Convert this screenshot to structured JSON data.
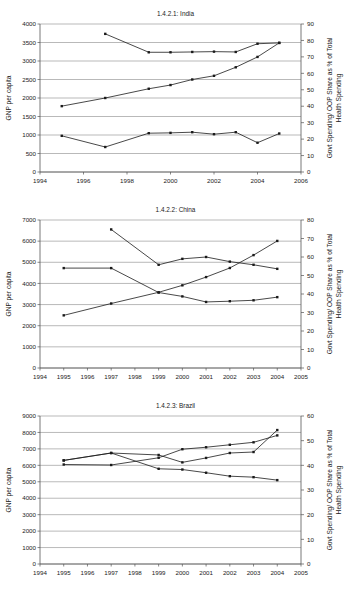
{
  "page": {
    "background": "#ffffff",
    "ink": "#1a1a1a",
    "grid_color": "#8a8a8a"
  },
  "charts": [
    {
      "id": "india",
      "title": "1.4.2.1: India",
      "ylabel": "GNP per capita",
      "ylabel_right": "Govt Spending/ OOP Share as % of Total Health Spending",
      "xlabel": "",
      "xlim": [
        1994,
        2006
      ],
      "xticks": [
        1994,
        1996,
        1998,
        2000,
        2002,
        2004,
        2006
      ],
      "ylim": [
        0,
        4000
      ],
      "yticks": [
        0,
        500,
        1000,
        1500,
        2000,
        2500,
        3000,
        3500,
        4000
      ],
      "ylim_right": [
        0,
        90
      ],
      "yticks_right": [
        0,
        10,
        20,
        30,
        40,
        50,
        60,
        70,
        80,
        90
      ],
      "series": [
        {
          "name": "GNP per capita",
          "axis": "left",
          "x": [
            1995,
            1997,
            1999,
            2000,
            2001,
            2002,
            2003,
            2004,
            2005
          ],
          "values": [
            1780,
            2000,
            2250,
            2350,
            2500,
            2600,
            2830,
            3110,
            3490
          ]
        },
        {
          "name": "OOP Share as % of Total Health Spending",
          "axis": "right",
          "x": [
            1997,
            1999,
            2000,
            2001,
            2002,
            2003,
            2004,
            2005
          ],
          "values": [
            84.0,
            72.8,
            72.8,
            73.0,
            73.2,
            73.0,
            78.0,
            78.5
          ]
        },
        {
          "name": "Govt Spending as % of Total Health Spending",
          "axis": "right",
          "x": [
            1995,
            1997,
            1999,
            2000,
            2001,
            2002,
            2003,
            2004,
            2005
          ],
          "values": [
            22.0,
            15.2,
            23.6,
            23.8,
            24.2,
            23.0,
            24.2,
            17.8,
            23.4
          ]
        }
      ]
    },
    {
      "id": "china",
      "title": "1.4.2.2: China",
      "ylabel": "GNP per capita",
      "ylabel_right": "Govt Spending/ OOP Share as % of Total Health Spending",
      "xlabel": "",
      "xlim": [
        1994,
        2005
      ],
      "xticks": [
        1994,
        1995,
        1996,
        1997,
        1998,
        1999,
        2000,
        2001,
        2002,
        2003,
        2004,
        2005
      ],
      "ylim": [
        0,
        7000
      ],
      "yticks": [
        0,
        1000,
        2000,
        3000,
        4000,
        5000,
        6000,
        7000
      ],
      "ylim_right": [
        0,
        80
      ],
      "yticks_right": [
        0,
        10,
        20,
        30,
        40,
        50,
        60,
        70,
        80
      ],
      "series": [
        {
          "name": "GNP per capita",
          "axis": "left",
          "x": [
            1995,
            1997,
            1999,
            2000,
            2001,
            2002,
            2003,
            2004
          ],
          "values": [
            2490,
            3050,
            3580,
            3910,
            4300,
            4730,
            5340,
            6010
          ]
        },
        {
          "name": "OOP Share as % of Total Health Spending",
          "axis": "right",
          "x": [
            1997,
            1999,
            2000,
            2001,
            2002,
            2003,
            2004
          ],
          "values": [
            74.9,
            55.8,
            59.0,
            60.0,
            57.5,
            55.8,
            53.6
          ]
        },
        {
          "name": "Govt Spending as % of Total Health Spending",
          "axis": "right",
          "x": [
            1995,
            1997,
            1999,
            2000,
            2001,
            2002,
            2003,
            2004
          ],
          "values": [
            54.0,
            54.0,
            40.8,
            38.7,
            35.7,
            36.1,
            36.6,
            38.3
          ]
        }
      ]
    },
    {
      "id": "brazil",
      "title": "1.4.2.3: Brazil",
      "ylabel": "GNP per capita",
      "ylabel_right": "Govt Spending/ OOP Share as % of Total Health Spending",
      "xlabel": "",
      "xlim": [
        1994,
        2005
      ],
      "xticks": [
        1994,
        1995,
        1996,
        1997,
        1998,
        1999,
        2000,
        2001,
        2002,
        2003,
        2004,
        2005
      ],
      "ylim": [
        0,
        9000
      ],
      "yticks": [
        0,
        1000,
        2000,
        3000,
        4000,
        5000,
        6000,
        7000,
        8000,
        9000
      ],
      "ylim_right": [
        0,
        60
      ],
      "yticks_right": [
        0,
        10,
        20,
        30,
        40,
        50,
        60
      ],
      "series": [
        {
          "name": "GNP per capita",
          "axis": "left",
          "x": [
            1995,
            1997,
            1999,
            2000,
            2001,
            2002,
            2003,
            2004
          ],
          "values": [
            6050,
            6020,
            6460,
            6980,
            7100,
            7250,
            7400,
            7820
          ]
        },
        {
          "name": "OOP Share as % of Total Health Spending",
          "axis": "right",
          "x": [
            1995,
            1997,
            1999,
            2000,
            2001,
            2002,
            2003,
            2004
          ],
          "values": [
            42.0,
            45.0,
            44.2,
            41.2,
            43.0,
            45.0,
            45.4,
            54.3
          ]
        },
        {
          "name": "Govt Spending as % of Total Health Spending",
          "axis": "right",
          "x": [
            1995,
            1997,
            1999,
            2000,
            2001,
            2002,
            2003,
            2004
          ],
          "values": [
            42.0,
            45.0,
            38.6,
            38.3,
            37.0,
            35.6,
            35.2,
            34.0
          ]
        }
      ]
    }
  ],
  "chart_data": [
    {
      "type": "line",
      "title": "1.4.2.1: India",
      "xlabel": "",
      "ylabel": "GNP per capita",
      "ylabel_secondary": "Govt Spending/ OOP Share as % of Total Health Spending",
      "xlim": [
        1994,
        2006
      ],
      "ylim": [
        0,
        4000
      ],
      "ylim_secondary": [
        0,
        90
      ],
      "xticks": [
        1994,
        1996,
        1998,
        2000,
        2002,
        2004,
        2006
      ],
      "yticks": [
        0,
        500,
        1000,
        1500,
        2000,
        2500,
        3000,
        3500,
        4000
      ],
      "yticks_secondary": [
        0,
        10,
        20,
        30,
        40,
        50,
        60,
        70,
        80,
        90
      ],
      "grid": true,
      "legend": "none",
      "series": [
        {
          "name": "GNP per capita",
          "axis": "primary",
          "x": [
            1995,
            1997,
            1999,
            2000,
            2001,
            2002,
            2003,
            2004,
            2005
          ],
          "y": [
            1780,
            2000,
            2250,
            2350,
            2500,
            2600,
            2830,
            3110,
            3490
          ]
        },
        {
          "name": "OOP Share as % of Total Health Spending",
          "axis": "secondary",
          "x": [
            1997,
            1999,
            2000,
            2001,
            2002,
            2003,
            2004,
            2005
          ],
          "y": [
            84.0,
            72.8,
            72.8,
            73.0,
            73.2,
            73.0,
            78.0,
            78.5
          ]
        },
        {
          "name": "Govt Spending as % of Total Health Spending",
          "axis": "secondary",
          "x": [
            1995,
            1997,
            1999,
            2000,
            2001,
            2002,
            2003,
            2004,
            2005
          ],
          "y": [
            22.0,
            15.2,
            23.6,
            23.8,
            24.2,
            23.0,
            24.2,
            17.8,
            23.4
          ]
        }
      ]
    },
    {
      "type": "line",
      "title": "1.4.2.2: China",
      "xlabel": "",
      "ylabel": "GNP per capita",
      "ylabel_secondary": "Govt Spending/ OOP Share as % of Total Health Spending",
      "xlim": [
        1994,
        2005
      ],
      "ylim": [
        0,
        7000
      ],
      "ylim_secondary": [
        0,
        80
      ],
      "xticks": [
        1994,
        1995,
        1996,
        1997,
        1998,
        1999,
        2000,
        2001,
        2002,
        2003,
        2004,
        2005
      ],
      "yticks": [
        0,
        1000,
        2000,
        3000,
        4000,
        5000,
        6000,
        7000
      ],
      "yticks_secondary": [
        0,
        10,
        20,
        30,
        40,
        50,
        60,
        70,
        80
      ],
      "grid": true,
      "legend": "none",
      "series": [
        {
          "name": "GNP per capita",
          "axis": "primary",
          "x": [
            1995,
            1997,
            1999,
            2000,
            2001,
            2002,
            2003,
            2004
          ],
          "y": [
            2490,
            3050,
            3580,
            3910,
            4300,
            4730,
            5340,
            6010
          ]
        },
        {
          "name": "OOP Share as % of Total Health Spending",
          "axis": "secondary",
          "x": [
            1997,
            1999,
            2000,
            2001,
            2002,
            2003,
            2004
          ],
          "y": [
            74.9,
            55.8,
            59.0,
            60.0,
            57.5,
            55.8,
            53.6
          ]
        },
        {
          "name": "Govt Spending as % of Total Health Spending",
          "axis": "secondary",
          "x": [
            1995,
            1997,
            1999,
            2000,
            2001,
            2002,
            2003,
            2004
          ],
          "y": [
            54.0,
            54.0,
            40.8,
            38.7,
            35.7,
            36.1,
            36.6,
            38.3
          ]
        }
      ]
    },
    {
      "type": "line",
      "title": "1.4.2.3: Brazil",
      "xlabel": "",
      "ylabel": "GNP per capita",
      "ylabel_secondary": "Govt Spending/ OOP Share as % of Total Health Spending",
      "xlim": [
        1994,
        2005
      ],
      "ylim": [
        0,
        9000
      ],
      "ylim_secondary": [
        0,
        60
      ],
      "xticks": [
        1994,
        1995,
        1996,
        1997,
        1998,
        1999,
        2000,
        2001,
        2002,
        2003,
        2004,
        2005
      ],
      "yticks": [
        0,
        1000,
        2000,
        3000,
        4000,
        5000,
        6000,
        7000,
        8000,
        9000
      ],
      "yticks_secondary": [
        0,
        10,
        20,
        30,
        40,
        50,
        60
      ],
      "grid": true,
      "legend": "none",
      "series": [
        {
          "name": "GNP per capita",
          "axis": "primary",
          "x": [
            1995,
            1997,
            1999,
            2000,
            2001,
            2002,
            2003,
            2004
          ],
          "y": [
            6050,
            6020,
            6460,
            6980,
            7100,
            7250,
            7400,
            7820
          ]
        },
        {
          "name": "OOP Share as % of Total Health Spending",
          "axis": "secondary",
          "x": [
            1995,
            1997,
            1999,
            2000,
            2001,
            2002,
            2003,
            2004
          ],
          "y": [
            42.0,
            45.0,
            44.2,
            41.2,
            43.0,
            45.0,
            45.4,
            54.3
          ]
        },
        {
          "name": "Govt Spending as % of Total Health Spending",
          "axis": "secondary",
          "x": [
            1995,
            1997,
            1999,
            2000,
            2001,
            2002,
            2003,
            2004
          ],
          "y": [
            42.0,
            45.0,
            38.6,
            38.3,
            37.0,
            35.6,
            35.2,
            34.0
          ]
        }
      ]
    }
  ]
}
